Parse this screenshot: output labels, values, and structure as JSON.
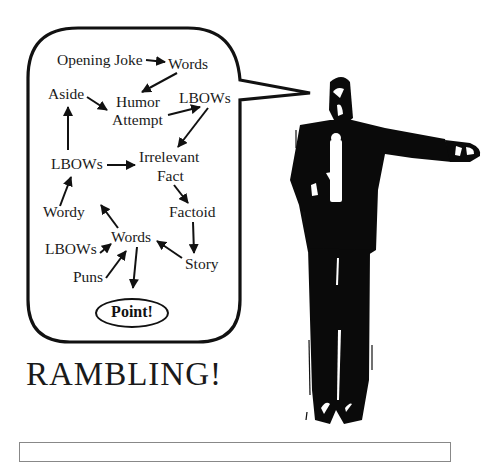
{
  "title": "RAMBLING!",
  "bubble": {
    "nodes": [
      {
        "id": "opening-joke",
        "label": "Opening Joke",
        "x": 57,
        "y": 51
      },
      {
        "id": "words-top",
        "label": "Words",
        "x": 168,
        "y": 55
      },
      {
        "id": "aside",
        "label": "Aside",
        "x": 48,
        "y": 85
      },
      {
        "id": "humor",
        "label": "Humor",
        "x": 116,
        "y": 93
      },
      {
        "id": "attempt",
        "label": "Attempt",
        "x": 112,
        "y": 111
      },
      {
        "id": "lbows-top",
        "label": "LBOWs",
        "x": 179,
        "y": 89
      },
      {
        "id": "lbows-mid",
        "label": "LBOWs",
        "x": 51,
        "y": 155
      },
      {
        "id": "irrelevant",
        "label": "Irrelevant",
        "x": 139,
        "y": 148
      },
      {
        "id": "fact",
        "label": "Fact",
        "x": 157,
        "y": 167
      },
      {
        "id": "wordy",
        "label": "Wordy",
        "x": 43,
        "y": 203
      },
      {
        "id": "factoid",
        "label": "Factoid",
        "x": 169,
        "y": 203
      },
      {
        "id": "words-mid",
        "label": "Words",
        "x": 111,
        "y": 228
      },
      {
        "id": "lbows-low",
        "label": "LBOWs",
        "x": 45,
        "y": 240
      },
      {
        "id": "story",
        "label": "Story",
        "x": 185,
        "y": 255
      },
      {
        "id": "puns",
        "label": "Puns",
        "x": 73,
        "y": 268
      }
    ],
    "point_label": "Point!"
  },
  "colors": {
    "ink": "#111111",
    "background": "#ffffff",
    "box_border": "#888888"
  }
}
